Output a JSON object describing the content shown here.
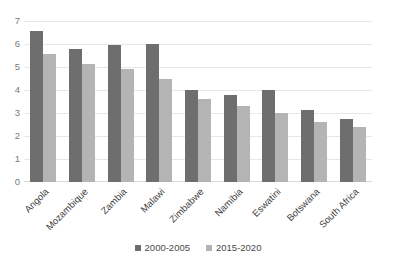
{
  "chart_data": {
    "type": "bar",
    "title": "",
    "subtitle": "",
    "xlabel": "",
    "ylabel": "",
    "ylim": [
      0,
      7
    ],
    "y_ticks": [
      0,
      1,
      2,
      3,
      4,
      5,
      6,
      7
    ],
    "grid": true,
    "legend_position": "bottom",
    "categories": [
      "Angola",
      "Mozambique",
      "Zambia",
      "Malawi",
      "Zimbabwe",
      "Namibia",
      "Eswatini",
      "Botswana",
      "South Africa"
    ],
    "series": [
      {
        "name": "2000-2005",
        "color": "#6e6e6e",
        "values": [
          6.55,
          5.8,
          5.95,
          6.0,
          4.0,
          3.8,
          4.0,
          3.15,
          2.75
        ]
      },
      {
        "name": "2015-2020",
        "color": "#b4b4b4",
        "values": [
          5.55,
          5.15,
          4.9,
          4.5,
          3.6,
          3.3,
          3.0,
          2.6,
          2.4
        ]
      }
    ]
  },
  "colors": {
    "series_1": "#6e6e6e",
    "series_2": "#b4b4b4",
    "gridline": "#e4e8ee",
    "axis_text": "#7a7a7a",
    "category_text": "#3f3f3f",
    "background": "#ffffff"
  }
}
